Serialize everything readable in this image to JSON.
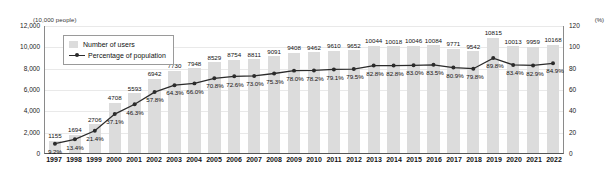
{
  "chart_data": {
    "type": "bar",
    "title": "",
    "xlabel": "",
    "ylabel": "(10,000 people)",
    "y2label": "(%)",
    "ylim": [
      0,
      12000
    ],
    "y2lim": [
      0,
      120
    ],
    "yticks": [
      "0",
      "2,000",
      "4,000",
      "6,000",
      "8,000",
      "10,000",
      "12,000"
    ],
    "y2ticks": [
      "0",
      "20",
      "40",
      "60",
      "80",
      "100",
      "120"
    ],
    "grid": true,
    "legend_position": "top-left",
    "categories": [
      "1997",
      "1998",
      "1999",
      "2000",
      "2001",
      "2002",
      "2003",
      "2004",
      "2005",
      "2006",
      "2007",
      "2008",
      "2009",
      "2010",
      "2011",
      "2012",
      "2013",
      "2014",
      "2015",
      "2016",
      "2017",
      "2018",
      "2019",
      "2020",
      "2021",
      "2022"
    ],
    "series": [
      {
        "name": "Number of users",
        "type": "bar",
        "axis": "left",
        "color": "#dcdcdc",
        "values": [
          1155,
          1694,
          2706,
          4708,
          5593,
          6942,
          7730,
          7948,
          8529,
          8754,
          8811,
          9091,
          9408,
          9462,
          9610,
          9652,
          10044,
          10018,
          10046,
          10084,
          9771,
          9542,
          10815,
          10013,
          9959,
          10168
        ],
        "labels": [
          "1155",
          "1694",
          "2706",
          "4708",
          "5593",
          "6942",
          "7730",
          "7948",
          "8529",
          "8754",
          "8811",
          "9091",
          "9408",
          "9462",
          "9610",
          "9652",
          "10044",
          "10018",
          "10046",
          "10084",
          "9771",
          "9542",
          "10815",
          "10013",
          "9959",
          "10168"
        ]
      },
      {
        "name": "Percentage of population",
        "type": "line",
        "axis": "right",
        "color": "#2b2b2b",
        "values": [
          9.2,
          13.4,
          21.4,
          37.1,
          46.3,
          57.8,
          64.3,
          66.0,
          70.8,
          72.6,
          73.0,
          75.3,
          78.0,
          78.2,
          79.1,
          79.5,
          82.8,
          82.8,
          83.0,
          83.5,
          80.9,
          79.8,
          89.8,
          83.4,
          82.9,
          84.9
        ],
        "labels": [
          "9.2%",
          "13.4%",
          "21.4%",
          "37.1%",
          "46.3%",
          "57.8%",
          "64.3%",
          "66.0%",
          "70.8%",
          "72.6%",
          "73.0%",
          "75.3%",
          "78.0%",
          "78.2%",
          "79.1%",
          "79.5%",
          "82.8%",
          "82.8%",
          "83.0%",
          "83.5%",
          "80.9%",
          "79.8%",
          "89.8%",
          "83.4%",
          "82.9%",
          "84.9%"
        ]
      }
    ]
  },
  "legend": {
    "items": [
      {
        "label": "Number of users",
        "marker": "square-swatch"
      },
      {
        "label": "Percentage of population",
        "marker": "line-with-dot"
      }
    ]
  }
}
